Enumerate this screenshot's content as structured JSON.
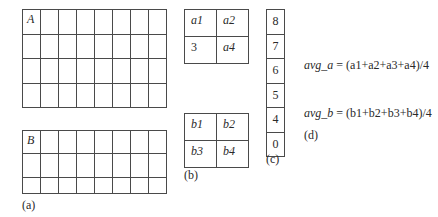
{
  "panel_a": {
    "label": "(a)",
    "grid_A": {
      "name": "A",
      "columns": 8,
      "rows": 4
    },
    "grid_B": {
      "name": "B",
      "columns": 8,
      "rows": 3
    }
  },
  "panel_b": {
    "label": "(b)",
    "grid_a": [
      [
        "a1",
        "a2"
      ],
      [
        "3",
        "a4"
      ]
    ],
    "grid_b": [
      [
        "b1",
        "b2"
      ],
      [
        "b3",
        "b4"
      ]
    ]
  },
  "panel_c": {
    "label": "(c)",
    "values": [
      "8",
      "7",
      "6",
      "5",
      "4",
      "0"
    ]
  },
  "panel_d": {
    "label": "(d)",
    "formula_a": {
      "lhs": "avg_a",
      "rhs": "= (a1+a2+a3+a4)/4"
    },
    "formula_b": {
      "lhs": "avg_b",
      "rhs": "= (b1+b2+b3+b4)/4"
    }
  }
}
